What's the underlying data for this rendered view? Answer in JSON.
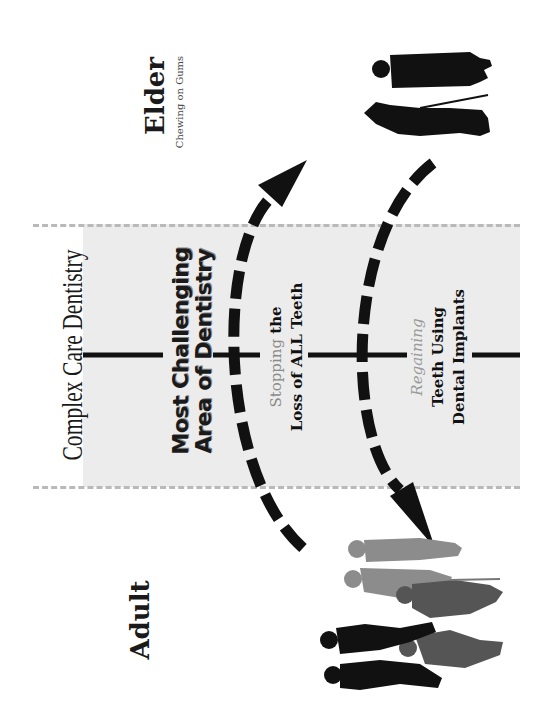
{
  "title": "Complex Care Dentistry",
  "stages": {
    "elder": {
      "label": "Elder",
      "sublabel": "Chewing on Gums"
    },
    "adult": {
      "label": "Adult"
    }
  },
  "band": {
    "heading_line1": "Most Challenging",
    "heading_line2": "Area of Dentistry",
    "stopping": {
      "highlight": "Stopping",
      "rest": " the",
      "line2": "Loss of ALL Teeth"
    },
    "regaining": {
      "highlight": "Regaining",
      "line2": "Teeth Using",
      "line3": "Dental Implants"
    }
  },
  "arrows": [
    {
      "name": "adult-to-elder-arrow",
      "direction": "up",
      "style": "dashed"
    },
    {
      "name": "elder-to-adult-arrow",
      "direction": "down",
      "style": "dashed"
    }
  ],
  "figures": {
    "elder_group": {
      "icon": "elderly-couple-silhouette",
      "color": "#111111"
    },
    "adult_group": {
      "icon": "adult-group-silhouette",
      "colors": [
        "#111111",
        "#555555",
        "#8c8c8c"
      ]
    }
  },
  "colors": {
    "band": "#ececec",
    "dash": "#b9b9b9",
    "ink": "#111111",
    "highlight_text": "#8a8a8a"
  }
}
